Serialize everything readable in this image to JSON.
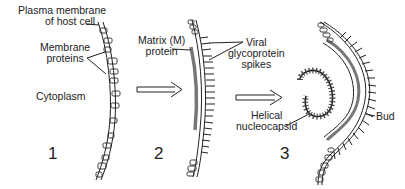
{
  "diagram": {
    "type": "process",
    "steps": [
      {
        "number": "1"
      },
      {
        "number": "2"
      },
      {
        "number": "3"
      }
    ],
    "labels": {
      "plasma_membrane_line1": "Plasma membrane",
      "plasma_membrane_line2": "of host cell",
      "membrane_proteins_line1": "Membrane",
      "membrane_proteins_line2": "proteins",
      "cytoplasm": "Cytoplasm",
      "matrix_line1": "Matrix (M)",
      "matrix_line2": "protein",
      "spikes_line1": "Viral",
      "spikes_line2": "glycoprotein",
      "spikes_line3": "spikes",
      "nucleocapsid_line1": "Helical",
      "nucleocapsid_line2": "nucleocapsid",
      "bud": "Bud"
    },
    "arrows": [
      {
        "from": "1",
        "to": "2"
      },
      {
        "from": "2",
        "to": "3"
      }
    ]
  }
}
